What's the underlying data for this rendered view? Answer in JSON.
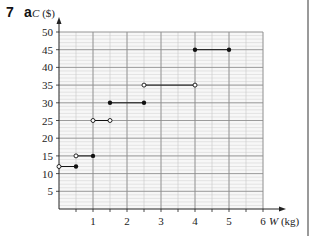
{
  "question": {
    "number": "7",
    "part": "a"
  },
  "chart_data": {
    "type": "line",
    "subtype": "step",
    "title": "",
    "xlabel": "W (kg)",
    "ylabel": "C ($)",
    "xlim": [
      0,
      6
    ],
    "ylim": [
      0,
      50
    ],
    "x_ticks": [
      1,
      2,
      3,
      4,
      5,
      6
    ],
    "x_tick_labels": [
      "1",
      "2",
      "3",
      "4",
      "5",
      "6"
    ],
    "y_ticks": [
      5,
      10,
      15,
      20,
      25,
      30,
      35,
      40,
      45,
      50
    ],
    "y_tick_labels": [
      "5",
      "10",
      "15",
      "20",
      "25",
      "30",
      "35",
      "40",
      "45",
      "50"
    ],
    "grid": true,
    "legend": null,
    "segments": [
      {
        "x0": 0,
        "x1": 0.5,
        "y": 12,
        "start": "open",
        "end": "closed"
      },
      {
        "x0": 0.5,
        "x1": 1,
        "y": 15,
        "start": "open",
        "end": "closed"
      },
      {
        "x0": 1,
        "x1": 1.5,
        "y": 25,
        "start": "open",
        "end": "open"
      },
      {
        "x0": 1.5,
        "x1": 2.5,
        "y": 30,
        "start": "closed",
        "end": "closed"
      },
      {
        "x0": 2.5,
        "x1": 4,
        "y": 35,
        "start": "open",
        "end": "open"
      },
      {
        "x0": 4,
        "x1": 5,
        "y": 45,
        "start": "closed",
        "end": "closed"
      }
    ]
  }
}
